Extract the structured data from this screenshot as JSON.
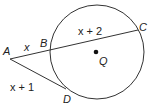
{
  "diagram": {
    "type": "secant-tangent circle figure",
    "points": {
      "A": {
        "label": "A",
        "x": 10,
        "y": 59
      },
      "B": {
        "label": "B",
        "x": 50,
        "y": 50
      },
      "C": {
        "label": "C",
        "x": 138,
        "y": 30
      },
      "D": {
        "label": "D",
        "x": 66,
        "y": 89
      },
      "Q": {
        "label": "Q",
        "x": 96,
        "y": 52
      }
    },
    "circle": {
      "cx": 97,
      "cy": 52,
      "r": 47,
      "center_label": "Q"
    },
    "segments": {
      "AB": {
        "label": "x"
      },
      "BC": {
        "label": "x + 2"
      },
      "AD": {
        "label": "x + 1"
      }
    },
    "colors": {
      "stroke": "#333333",
      "text": "#222222"
    }
  }
}
